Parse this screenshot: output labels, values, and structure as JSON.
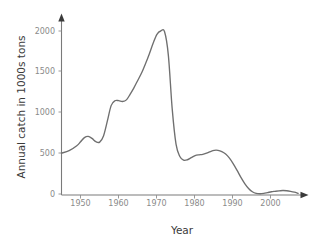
{
  "chart_data": {
    "type": "line",
    "title": "",
    "subtitle": "",
    "xlabel": "Year",
    "ylabel": "Annual catch in 1000s tons",
    "xlim": [
      1945,
      2008
    ],
    "ylim": [
      0,
      2150
    ],
    "xticks": [
      1950,
      1960,
      1970,
      1980,
      1990,
      2000
    ],
    "xtick_labels": [
      "1950",
      "1960",
      "1970",
      "1980",
      "1990",
      "2000"
    ],
    "yticks": [
      0,
      500,
      1000,
      1500,
      2000
    ],
    "ytick_labels": [
      "0",
      "500",
      "1000",
      "1500",
      "2000"
    ],
    "grid": false,
    "legend": null,
    "legend_position": "none",
    "line_color": "#6f6f6f",
    "axis_color": "#7a7a7a",
    "tick_label_color": "#8a8a8a",
    "axis_title_color": "#3a3a3a",
    "background_color": "#ffffff",
    "series": [
      {
        "name": "Annual catch",
        "x": [
          1945,
          1947,
          1949,
          1950,
          1951,
          1952,
          1953,
          1954,
          1955,
          1956,
          1957,
          1958,
          1959,
          1960,
          1961,
          1962,
          1963,
          1964,
          1965,
          1966,
          1967,
          1968,
          1969,
          1970,
          1971,
          1972,
          1973,
          1974,
          1975,
          1976,
          1977,
          1978,
          1979,
          1980,
          1981,
          1982,
          1983,
          1984,
          1985,
          1986,
          1987,
          1988,
          1989,
          1990,
          1991,
          1992,
          1993,
          1994,
          1995,
          1996,
          1997,
          1998,
          1999,
          2000,
          2001,
          2002,
          2003,
          2004,
          2005,
          2006,
          2007
        ],
        "y": [
          510,
          540,
          600,
          650,
          700,
          715,
          690,
          650,
          645,
          720,
          900,
          1090,
          1150,
          1150,
          1140,
          1160,
          1230,
          1310,
          1400,
          1490,
          1600,
          1720,
          1850,
          1960,
          2000,
          1990,
          1700,
          1050,
          620,
          470,
          425,
          430,
          455,
          480,
          490,
          495,
          510,
          530,
          545,
          545,
          530,
          500,
          450,
          380,
          300,
          215,
          140,
          80,
          40,
          20,
          15,
          20,
          30,
          40,
          45,
          50,
          55,
          52,
          45,
          35,
          20
        ]
      }
    ]
  },
  "axis_labels": {
    "x_title": "Year",
    "y_title": "Annual catch in 1000s tons"
  }
}
